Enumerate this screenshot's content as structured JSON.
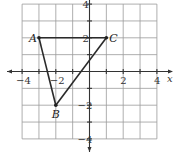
{
  "figure": {
    "type": "coordinate-plane-triangle",
    "x_range": [
      -4,
      4
    ],
    "y_range": [
      -4,
      4
    ],
    "grid_step": 1,
    "axis_name_x": "x",
    "x_tick_labels": [
      {
        "value": -4,
        "text": "−4"
      },
      {
        "value": -2,
        "text": "−2"
      },
      {
        "value": 2,
        "text": "2"
      },
      {
        "value": 4,
        "text": "4"
      }
    ],
    "y_tick_labels": [
      {
        "value": 4,
        "text": "4"
      },
      {
        "value": 2,
        "text": "2"
      },
      {
        "value": -2,
        "text": "−2"
      },
      {
        "value": -4,
        "text": "−4"
      }
    ],
    "vertices": [
      {
        "name": "A",
        "x": -3,
        "y": 2,
        "label_pos": "left"
      },
      {
        "name": "B",
        "x": -2,
        "y": -2,
        "label_pos": "below"
      },
      {
        "name": "C",
        "x": 1,
        "y": 2,
        "label_pos": "right"
      }
    ],
    "edges": [
      [
        "A",
        "B"
      ],
      [
        "B",
        "C"
      ],
      [
        "C",
        "A"
      ]
    ],
    "colors": {
      "grid": "#9a9a9a",
      "axis": "#333333",
      "triangle": "#2a2a2a"
    }
  }
}
